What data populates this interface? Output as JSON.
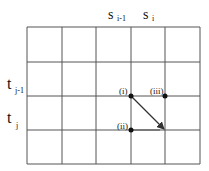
{
  "diagram": {
    "grid": {
      "cols": 5,
      "rows": 4,
      "x": [
        27,
        62,
        96,
        131,
        165,
        200
      ],
      "y": [
        27,
        62,
        96,
        130,
        164
      ],
      "line_color": "#555555"
    },
    "column_labels": [
      {
        "base": "s",
        "sub": "i-1",
        "x": 108,
        "y": 19
      },
      {
        "base": "s",
        "sub": "i",
        "x": 144,
        "y": 19
      }
    ],
    "row_labels": [
      {
        "base": "t",
        "sub": "j-1",
        "x": 7,
        "y": 89
      },
      {
        "base": "t",
        "sub": "j",
        "x": 7,
        "y": 123
      }
    ],
    "points": [
      {
        "label": "(i)",
        "x": 131,
        "y": 96,
        "label_x": 120,
        "label_y": 93
      },
      {
        "label": "(iii)",
        "x": 165,
        "y": 96,
        "label_x": 150,
        "label_y": 93
      },
      {
        "label": "(ii)",
        "x": 131,
        "y": 130,
        "label_x": 117,
        "label_y": 128
      }
    ],
    "arrow": {
      "from": [
        131,
        96
      ],
      "to": [
        165,
        130
      ],
      "color": "#333333"
    }
  }
}
